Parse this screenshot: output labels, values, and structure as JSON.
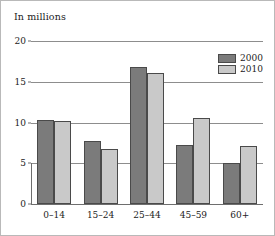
{
  "chart_data": {
    "type": "bar",
    "title": "In millions",
    "xlabel": "",
    "ylabel": "",
    "ylim": [
      0,
      20
    ],
    "yticks": [
      0,
      5,
      10,
      15,
      20
    ],
    "ytick_labels": [
      "0",
      "5",
      "10",
      "15",
      "20"
    ],
    "grid": true,
    "legend_position": "top-right",
    "categories": [
      "0–14",
      "15–24",
      "25–44",
      "45–59",
      "60+"
    ],
    "series": [
      {
        "name": "2000",
        "color": "#7b7b7b",
        "values": [
          10.3,
          7.7,
          16.8,
          7.2,
          5.0
        ]
      },
      {
        "name": "2010",
        "color": "#c9c9c9",
        "values": [
          10.2,
          6.7,
          16.1,
          10.6,
          7.1
        ]
      }
    ]
  },
  "figure": {
    "border_color": "#b9b9b9",
    "background": "#ffffff",
    "gridline_color": "#8d8d8d",
    "axis_color": "#6e6e6e",
    "bar_outline_color": "#4a4a4a"
  }
}
